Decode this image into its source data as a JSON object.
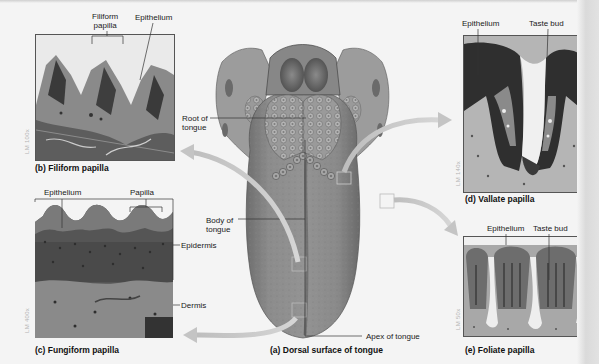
{
  "figure": {
    "main_caption": "(a) Dorsal surface of tongue",
    "tongue_labels": {
      "root": "Root of\ntongue",
      "root_line1": "Root of",
      "root_line2": "tongue",
      "body_line1": "Body of",
      "body_line2": "tongue",
      "apex": "Apex of tongue"
    },
    "panels": [
      {
        "id": "b",
        "caption": "(b) Filiform papilla",
        "magnification": "LM 100x",
        "labels": [
          "Filiform papilla",
          "Epithelium"
        ],
        "label_filiform_line1": "Filiform",
        "label_filiform_line2": "papilla",
        "label_epithelium": "Epithelium"
      },
      {
        "id": "c",
        "caption": "(c) Fungiform papilla",
        "magnification": "LM 400x",
        "labels": [
          "Epithelium",
          "Papilla",
          "Epidermis",
          "Dermis"
        ],
        "label_epithelium": "Epithelium",
        "label_papilla": "Papilla",
        "label_epidermis": "Epidermis",
        "label_dermis": "Dermis"
      },
      {
        "id": "d",
        "caption": "(d) Vallate papilla",
        "magnification": "LM 140x",
        "labels": [
          "Epithelium",
          "Taste bud"
        ],
        "label_epithelium": "Epithelium",
        "label_taste_bud": "Taste bud"
      },
      {
        "id": "e",
        "caption": "(e) Foliate papilla",
        "magnification": "LM 50x",
        "labels": [
          "Epithelium",
          "Taste bud"
        ],
        "label_epithelium": "Epithelium",
        "label_taste_bud": "Taste bud"
      }
    ]
  },
  "colors": {
    "background": "#f4f4f4",
    "tongue_fill": "#8e8e8e",
    "arrow": "#c8c8c8",
    "label_text": "#1a1a1a",
    "magnification_text": "#b5b5b5"
  }
}
